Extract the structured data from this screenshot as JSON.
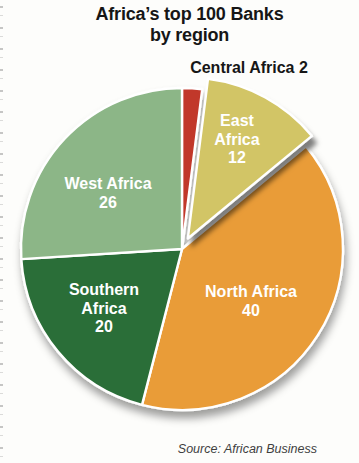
{
  "page": {
    "title_line1": "Africa’s top 100 Banks",
    "title_line2": "by region",
    "source": "Source: African Business"
  },
  "chart_data": {
    "type": "pie",
    "title": "Africa’s top 100 Banks by region",
    "unit": "banks",
    "total": 100,
    "start_angle_deg": 0,
    "direction": "clockwise",
    "legend_position": "labels-on-slices",
    "slices": [
      {
        "label": "Central Africa",
        "value": 2,
        "color": "#c1372a",
        "label_placement": "outside-top",
        "exploded": false
      },
      {
        "label": "East Africa",
        "value": 12,
        "color": "#d2c566",
        "label_placement": "inside",
        "exploded": true
      },
      {
        "label": "North Africa",
        "value": 40,
        "color": "#e99c38",
        "label_placement": "inside",
        "exploded": false
      },
      {
        "label": "Southern Africa",
        "value": 20,
        "color": "#2b6e38",
        "label_placement": "inside",
        "exploded": false
      },
      {
        "label": "West Africa",
        "value": 26,
        "color": "#8cb687",
        "label_placement": "inside",
        "exploded": false
      }
    ]
  },
  "slice_labels": {
    "central": "Central Africa 2",
    "east": {
      "line1": "East",
      "line2": "Africa",
      "line3": "12"
    },
    "north": {
      "line1": "North Africa",
      "line2": "40"
    },
    "southern": {
      "line1": "Southern",
      "line2": "Africa",
      "line3": "20"
    },
    "west": {
      "line1": "West Africa",
      "line2": "26"
    }
  }
}
